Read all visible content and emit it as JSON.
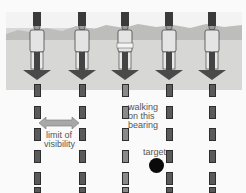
{
  "figure": {
    "columns": 5,
    "labels": {
      "limit": "limit of visibility",
      "limit_line1": "limit of",
      "limit_line2": "visibility",
      "walking_line1": "walking",
      "walking_line2": "on this",
      "walking_line3": "bearing",
      "target": "target"
    },
    "colors": {
      "ground": "#d7d7d5",
      "arrow": "#4a4a4a",
      "dash": "#5a5a5a",
      "middle_dash": "#8a8a8a",
      "target": "#0a0a0a",
      "double_arrow": "#a8a8a8"
    }
  }
}
